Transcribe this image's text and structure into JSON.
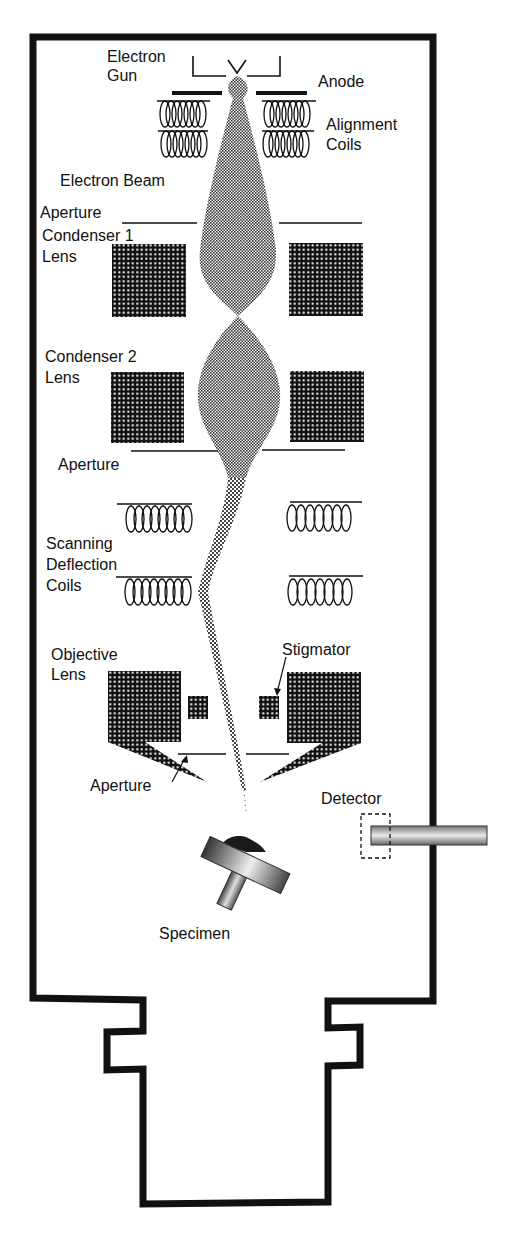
{
  "colors": {
    "ink": "#111111",
    "background": "#ffffff",
    "beam": "#8a8a8a",
    "lens_fill": "#111111",
    "lens_dot": "#ffffff"
  },
  "labels": {
    "electron_gun": [
      "Electron",
      "Gun"
    ],
    "anode": "Anode",
    "alignment_coils": [
      "Alignment",
      "Coils"
    ],
    "electron_beam": "Electron Beam",
    "aperture_1": "Aperture",
    "condenser_1": [
      "Condenser 1",
      "Lens"
    ],
    "condenser_2": [
      "Condenser 2",
      "Lens"
    ],
    "aperture_2": "Aperture",
    "scanning_coils": [
      "Scanning",
      "Deflection",
      "Coils"
    ],
    "objective_lens": [
      "Objective",
      "Lens"
    ],
    "stigmator": "Stigmator",
    "aperture_3": "Aperture",
    "detector": "Detector",
    "specimen": "Specimen"
  },
  "components": [
    "electron-gun",
    "anode",
    "alignment-coils",
    "electron-beam",
    "aperture",
    "condenser-1-lens",
    "condenser-2-lens",
    "aperture",
    "scanning-deflection-coils",
    "objective-lens",
    "stigmator",
    "aperture",
    "detector",
    "specimen"
  ]
}
